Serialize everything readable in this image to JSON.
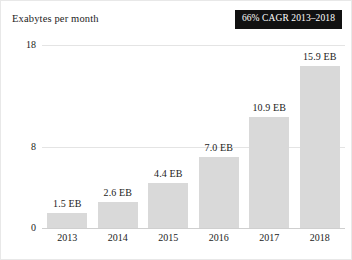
{
  "badge": {
    "label": "66% CAGR 2013–2018",
    "background": "#111111",
    "text_color": "#ffffff"
  },
  "chart_data": {
    "type": "bar",
    "title": "Exabytes per month",
    "xlabel": "",
    "ylabel": "Exabytes per month",
    "categories": [
      "2013",
      "2014",
      "2015",
      "2016",
      "2017",
      "2018"
    ],
    "values": [
      1.5,
      2.6,
      4.4,
      7.0,
      10.9,
      15.9
    ],
    "data_labels": [
      "1.5 EB",
      "2.6 EB",
      "4.4 EB",
      "7.0 EB",
      "10.9 EB",
      "15.9 EB"
    ],
    "ylim": [
      0,
      18
    ],
    "yticks": [
      0,
      8,
      18
    ],
    "ytick_labels": [
      "0",
      "8",
      "18"
    ],
    "grid": true,
    "legend": "none",
    "bar_color": "#d9d9d9",
    "annotations": [
      "66% CAGR 2013–2018"
    ]
  }
}
